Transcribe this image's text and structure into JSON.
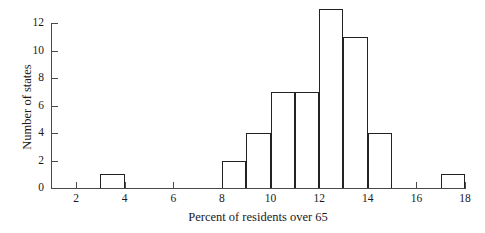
{
  "chart_data": {
    "type": "bar",
    "title": "",
    "subtitle": "",
    "xlabel": "Percent of residents over 65",
    "ylabel": "Number of states",
    "xlim": [
      1,
      18.6
    ],
    "ylim": [
      0,
      13.6
    ],
    "xticks": [
      2,
      4,
      6,
      8,
      10,
      12,
      14,
      16,
      18
    ],
    "xtick_labels": [
      "2",
      "4",
      "6",
      "8",
      "10",
      "12",
      "14",
      "16",
      "18"
    ],
    "yticks": [
      0,
      2,
      4,
      6,
      8,
      10,
      12
    ],
    "ytick_labels": [
      "0",
      "2",
      "4",
      "6",
      "8",
      "10",
      "12"
    ],
    "grid": false,
    "legend": null,
    "bin_width": 1,
    "categories": [
      "3-4",
      "8-9",
      "9-10",
      "10-11",
      "11-12",
      "12-13",
      "13-14",
      "14-15",
      "17-18"
    ],
    "values": [
      1,
      2,
      4,
      7,
      7,
      13,
      11,
      4,
      1
    ],
    "bars": [
      {
        "bin_start": 3,
        "bin_end": 4,
        "value": 1
      },
      {
        "bin_start": 8,
        "bin_end": 9,
        "value": 2
      },
      {
        "bin_start": 9,
        "bin_end": 10,
        "value": 4
      },
      {
        "bin_start": 10,
        "bin_end": 11,
        "value": 7
      },
      {
        "bin_start": 11,
        "bin_end": 12,
        "value": 7
      },
      {
        "bin_start": 12,
        "bin_end": 13,
        "value": 13
      },
      {
        "bin_start": 13,
        "bin_end": 14,
        "value": 11
      },
      {
        "bin_start": 14,
        "bin_end": 15,
        "value": 4
      },
      {
        "bin_start": 17,
        "bin_end": 18,
        "value": 1
      }
    ],
    "total": 50,
    "colors": {
      "bar_outline": "#222222",
      "bar_fill": "transparent",
      "axis": "#4a4a4a",
      "text": "#1a1a1a",
      "background": "#ffffff"
    }
  }
}
